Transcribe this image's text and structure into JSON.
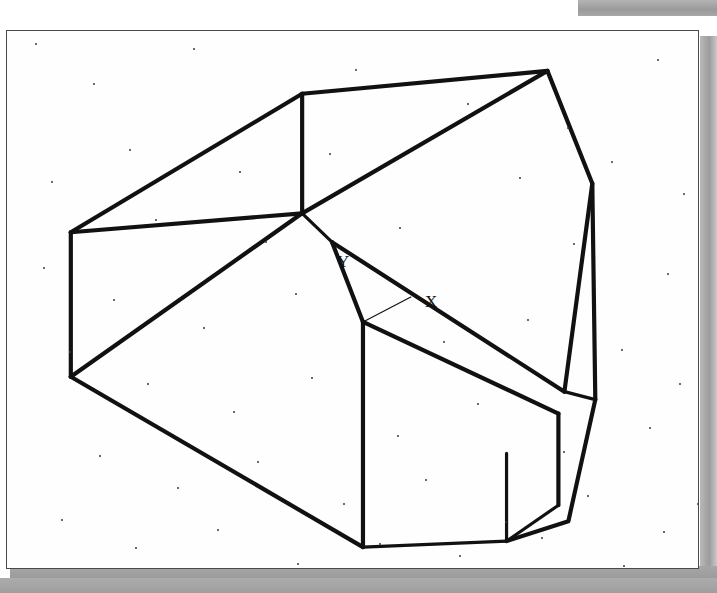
{
  "document": {
    "kind": "scanned-technical-drawing",
    "page_background": "#fefefe",
    "border_color": "#4a4a4a",
    "scan_shadow_color": "#9d9d9d",
    "line_color": "#111111"
  },
  "annotations": {
    "axis_y_label": "Y",
    "axis_x_label": "X"
  },
  "chart_data": {
    "type": "line",
    "title": "",
    "xlabel": "X",
    "ylabel": "Y",
    "view": {
      "width": 693,
      "height": 539,
      "grid": false,
      "legend": "none"
    },
    "vertices": {
      "top_left_upper": [
        296,
        63
      ],
      "top_right": [
        542,
        40
      ],
      "left_upper": [
        64,
        202
      ],
      "left_lower": [
        64,
        347
      ],
      "center_node": [
        296,
        183
      ],
      "center_node_lower": [
        326,
        212
      ],
      "mid_front": [
        357,
        292
      ],
      "bottom_front": [
        357,
        518
      ],
      "right_upper_break": [
        587,
        153
      ],
      "right_lower_break": [
        590,
        370
      ],
      "right_cross": [
        559,
        362
      ],
      "box_right_top": [
        553,
        384
      ],
      "box_right_bottom": [
        553,
        476
      ],
      "box_left_bottom": [
        501,
        512
      ],
      "bottom_tail": [
        563,
        492
      ]
    },
    "series": [
      {
        "name": "top-rear-edge",
        "points": [
          [
            296,
            63
          ],
          [
            542,
            40
          ]
        ]
      },
      {
        "name": "upper-left-slant",
        "points": [
          [
            64,
            202
          ],
          [
            296,
            63
          ]
        ]
      },
      {
        "name": "upper-left-horizontal",
        "points": [
          [
            64,
            202
          ],
          [
            296,
            183
          ]
        ]
      },
      {
        "name": "vertical-rear-edge",
        "points": [
          [
            296,
            63
          ],
          [
            296,
            183
          ]
        ]
      },
      {
        "name": "upper-right-diagonal",
        "points": [
          [
            296,
            183
          ],
          [
            542,
            40
          ]
        ]
      },
      {
        "name": "left-vertical-edge",
        "points": [
          [
            64,
            202
          ],
          [
            64,
            347
          ]
        ]
      },
      {
        "name": "left-lower-diagonal",
        "points": [
          [
            64,
            347
          ],
          [
            296,
            183
          ]
        ]
      },
      {
        "name": "left-bottom-long",
        "points": [
          [
            64,
            347
          ],
          [
            357,
            518
          ]
        ]
      },
      {
        "name": "center-stub",
        "points": [
          [
            296,
            183
          ],
          [
            326,
            212
          ]
        ]
      },
      {
        "name": "center-to-front",
        "points": [
          [
            326,
            212
          ],
          [
            357,
            292
          ]
        ]
      },
      {
        "name": "front-vertical",
        "points": [
          [
            357,
            292
          ],
          [
            357,
            518
          ]
        ]
      },
      {
        "name": "front-bottom",
        "points": [
          [
            357,
            518
          ],
          [
            501,
            512
          ]
        ]
      },
      {
        "name": "mid-right-diagonal",
        "points": [
          [
            326,
            212
          ],
          [
            559,
            362
          ]
        ]
      },
      {
        "name": "front-top-diagonal",
        "points": [
          [
            357,
            292
          ],
          [
            553,
            384
          ]
        ]
      },
      {
        "name": "box-right-vertical",
        "points": [
          [
            553,
            384
          ],
          [
            553,
            476
          ]
        ]
      },
      {
        "name": "box-bottom-right",
        "points": [
          [
            501,
            512
          ],
          [
            553,
            476
          ]
        ]
      },
      {
        "name": "box-left-vertical",
        "points": [
          [
            501,
            424
          ],
          [
            501,
            512
          ]
        ]
      },
      {
        "name": "right-tall-edge",
        "points": [
          [
            542,
            40
          ],
          [
            587,
            153
          ],
          [
            590,
            370
          ]
        ]
      },
      {
        "name": "right-inner-edge",
        "points": [
          [
            587,
            153
          ],
          [
            559,
            362
          ]
        ]
      },
      {
        "name": "right-lower-taper",
        "points": [
          [
            590,
            370
          ],
          [
            563,
            492
          ],
          [
            501,
            512
          ]
        ]
      },
      {
        "name": "right-cross-short",
        "points": [
          [
            559,
            362
          ],
          [
            590,
            370
          ]
        ]
      },
      {
        "name": "leader-thin",
        "points": [
          [
            357,
            292
          ],
          [
            405,
            267
          ]
        ]
      }
    ],
    "labels": [
      {
        "text": "Y",
        "x": 330,
        "y": 222
      },
      {
        "text": "X",
        "x": 418,
        "y": 262
      }
    ],
    "noise_dots": [
      [
        28,
        12
      ],
      [
        186,
        17
      ],
      [
        348,
        38
      ],
      [
        460,
        72
      ],
      [
        560,
        96
      ],
      [
        650,
        28
      ],
      [
        86,
        52
      ],
      [
        122,
        118
      ],
      [
        232,
        140
      ],
      [
        322,
        122
      ],
      [
        44,
        150
      ],
      [
        512,
        146
      ],
      [
        604,
        130
      ],
      [
        676,
        162
      ],
      [
        148,
        188
      ],
      [
        258,
        210
      ],
      [
        392,
        196
      ],
      [
        566,
        212
      ],
      [
        660,
        242
      ],
      [
        36,
        236
      ],
      [
        106,
        268
      ],
      [
        196,
        296
      ],
      [
        288,
        262
      ],
      [
        436,
        310
      ],
      [
        520,
        288
      ],
      [
        614,
        318
      ],
      [
        672,
        352
      ],
      [
        62,
        320
      ],
      [
        140,
        352
      ],
      [
        226,
        380
      ],
      [
        304,
        346
      ],
      [
        390,
        404
      ],
      [
        470,
        372
      ],
      [
        556,
        420
      ],
      [
        642,
        396
      ],
      [
        92,
        424
      ],
      [
        170,
        456
      ],
      [
        250,
        430
      ],
      [
        336,
        472
      ],
      [
        418,
        448
      ],
      [
        498,
        490
      ],
      [
        580,
        464
      ],
      [
        656,
        500
      ],
      [
        54,
        488
      ],
      [
        128,
        516
      ],
      [
        210,
        498
      ],
      [
        290,
        532
      ],
      [
        372,
        512
      ],
      [
        452,
        524
      ],
      [
        534,
        506
      ],
      [
        616,
        534
      ],
      [
        690,
        472
      ]
    ]
  }
}
